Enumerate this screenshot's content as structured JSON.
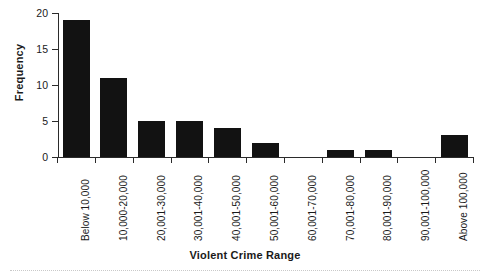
{
  "chart_data": {
    "type": "bar",
    "title": "",
    "xlabel": "Violent Crime Range",
    "ylabel": "Frequency",
    "categories": [
      "Below 10,000",
      "10,000-20,000",
      "20,001-30,000",
      "30,001-40,000",
      "40,001-50,000",
      "50,001-60,000",
      "60,001-70,000",
      "70,001-80,000",
      "80,001-90,000",
      "90,001-100,000",
      "Above 100,000"
    ],
    "values": [
      19,
      11,
      5,
      5,
      4,
      2,
      0,
      1,
      1,
      0,
      3
    ],
    "ylim": [
      0,
      20
    ],
    "yticks": [
      0,
      5,
      10,
      15,
      20
    ],
    "ytick_labels": [
      "0",
      "5",
      "10",
      "15",
      "20"
    ],
    "grid": false,
    "legend": false,
    "bar_color": "#121212",
    "axis_color": "#2b2b2b",
    "text_color": "#1a1a1a",
    "background": "#ffffff"
  }
}
